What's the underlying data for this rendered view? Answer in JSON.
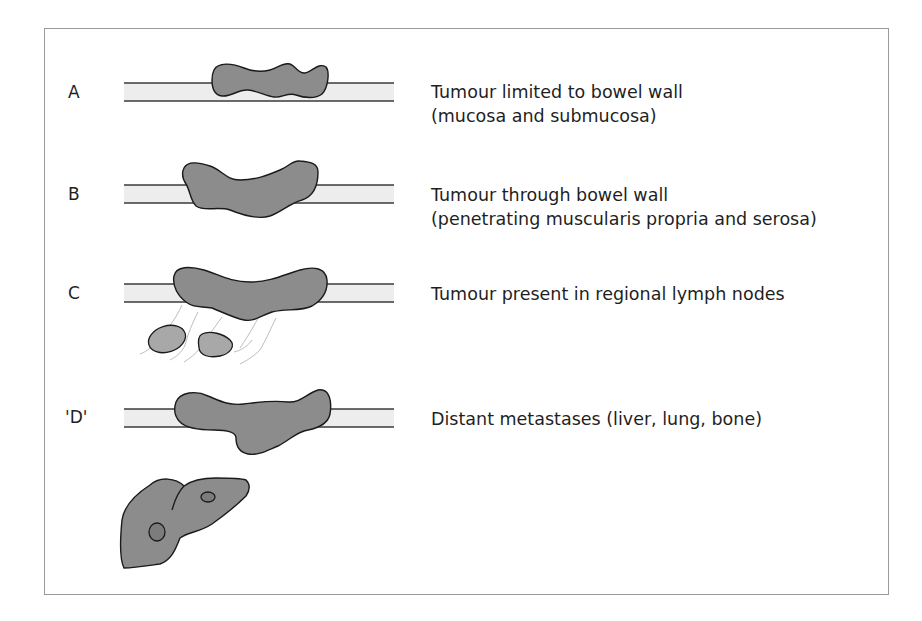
{
  "figure": {
    "colors": {
      "frame": "#9a9a9a",
      "bowel_wall_fill": "#ededed",
      "bowel_wall_line": "#3a3a3a",
      "tumour_fill": "#8c8c8c",
      "tumour_outline": "#1a1a1a",
      "lymph_node_fill": "#a8a8a8",
      "lymphatic_line": "#b5b5b5",
      "metastasis_fill": "#7c7c7c"
    },
    "stages": [
      {
        "label": "A",
        "description_lines": [
          "Tumour limited to bowel wall",
          "(mucosa and submucosa)"
        ]
      },
      {
        "label": "B",
        "description_lines": [
          "Tumour through bowel wall",
          "(penetrating muscularis propria and serosa)"
        ]
      },
      {
        "label": "C",
        "description_lines": [
          "Tumour present in regional lymph nodes"
        ]
      },
      {
        "label": "'D'",
        "description_lines": [
          "Distant metastases (liver, lung, bone)"
        ]
      }
    ]
  }
}
